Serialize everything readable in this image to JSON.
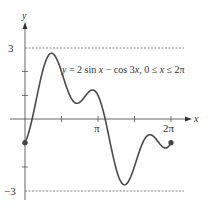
{
  "chart_data": {
    "type": "line",
    "title": "y = 2 sin x − cos 3x, 0 ≤ x ≤ 2π",
    "xlabel": "x",
    "ylabel": "y",
    "xlim": [
      0,
      6.2832
    ],
    "ylim": [
      -3,
      3
    ],
    "x_tick_labels": [
      "π",
      "2π"
    ],
    "y_tick_labels": [
      "3",
      "−3"
    ],
    "grid": false,
    "legend": null,
    "annotations": [
      {
        "text": "y = 2 sin x − cos 3x, 0 ≤ x ≤ 2π",
        "position": "upper right"
      },
      {
        "text": "dashed line y = 3"
      },
      {
        "text": "dashed line y = −3"
      },
      {
        "text": "endpoint markers at (0, −1) and (2π, −1)"
      }
    ],
    "series": [
      {
        "name": "y = 2 sin x − cos 3x",
        "x": [
          0,
          0.3,
          0.5,
          0.7,
          0.9,
          1.05,
          1.2,
          1.4,
          1.6,
          1.8,
          2.0,
          2.2,
          2.4,
          2.6,
          2.8,
          3.0,
          3.2,
          3.4,
          3.6,
          3.8,
          4.0,
          4.2,
          4.4,
          4.6,
          4.8,
          5.0,
          5.2,
          5.4,
          5.6,
          5.8,
          6.0,
          6.2832
        ],
        "values": [
          -1,
          -0.03,
          0.89,
          1.79,
          2.47,
          2.74,
          2.76,
          2.46,
          1.91,
          1.31,
          0.86,
          0.67,
          0.74,
          0.98,
          1.19,
          1.19,
          0.87,
          0.2,
          -0.68,
          -1.61,
          -2.36,
          -2.74,
          -2.7,
          -2.36,
          -1.85,
          -1.16,
          -0.77,
          -0.69,
          -0.8,
          -1.07,
          -1.22,
          -1
        ]
      }
    ]
  },
  "labels": {
    "y_axis": "y",
    "x_axis": "x",
    "y_max": "3",
    "y_min": "−3",
    "pi": "π",
    "two_pi": "2π",
    "equation_y": "y",
    "equation_rest": " = 2 sin ",
    "equation_x1": "x",
    "equation_mid": " − cos 3",
    "equation_x2": "x",
    "equation_domain1": ", 0 ≤ ",
    "equation_x3": "x",
    "equation_domain2": " ≤ 2π"
  },
  "colors": {
    "curve": "#4a4a4a",
    "axis": "#555555",
    "dashed": "#666666",
    "text": "#333333"
  }
}
